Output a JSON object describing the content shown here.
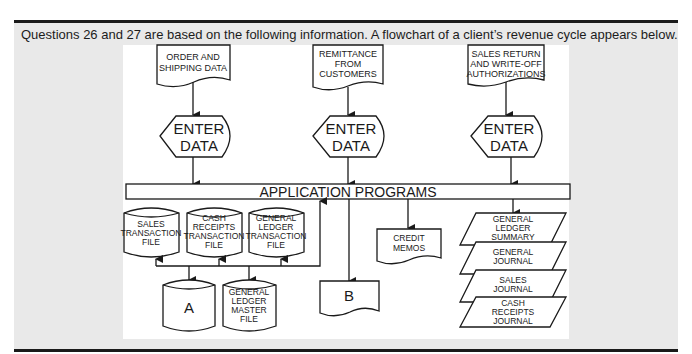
{
  "question_text": "Questions 26 and 27 are based on the following information. A flowchart of a client’s revenue cycle appears below.",
  "flowchart": {
    "inputs": [
      {
        "lines": [
          "ORDER AND",
          "SHIPPING DATA"
        ],
        "shape": "document"
      },
      {
        "lines": [
          "REMITTANCE",
          "FROM",
          "CUSTOMERS"
        ],
        "shape": "document"
      },
      {
        "lines": [
          "SALES RETURN",
          "AND WRITE-OFF",
          "AUTHORIZATIONS"
        ],
        "shape": "document"
      }
    ],
    "enter_data": {
      "lines": [
        "ENTER",
        "DATA"
      ],
      "shape": "display"
    },
    "application_programs": "APPLICATION PROGRAMS",
    "transaction_files": [
      {
        "lines": [
          "SALES",
          "TRANSACTION",
          "FILE"
        ]
      },
      {
        "lines": [
          "CASH",
          "RECEIPTS",
          "TRANSACTION",
          "FILE"
        ]
      },
      {
        "lines": [
          "GENERAL",
          "LEDGER",
          "TRANSACTION",
          "FILE"
        ]
      }
    ],
    "master_files": [
      {
        "lines": [
          "A"
        ]
      },
      {
        "lines": [
          "GENERAL",
          "LEDGER",
          "MASTER",
          "FILE"
        ]
      }
    ],
    "document_b": "B",
    "credit_memos": [
      "CREDIT",
      "MEMOS"
    ],
    "journals": [
      {
        "lines": [
          "GENERAL",
          "LEDGER",
          "SUMMARY"
        ]
      },
      {
        "lines": [
          "GENERAL",
          "JOURNAL"
        ]
      },
      {
        "lines": [
          "SALES",
          "JOURNAL"
        ]
      },
      {
        "lines": [
          "CASH",
          "RECEIPTS",
          "JOURNAL"
        ]
      }
    ]
  },
  "colors": {
    "panel_gray": "#e9e9e9",
    "line": "#1a1a1a",
    "white": "#ffffff"
  }
}
